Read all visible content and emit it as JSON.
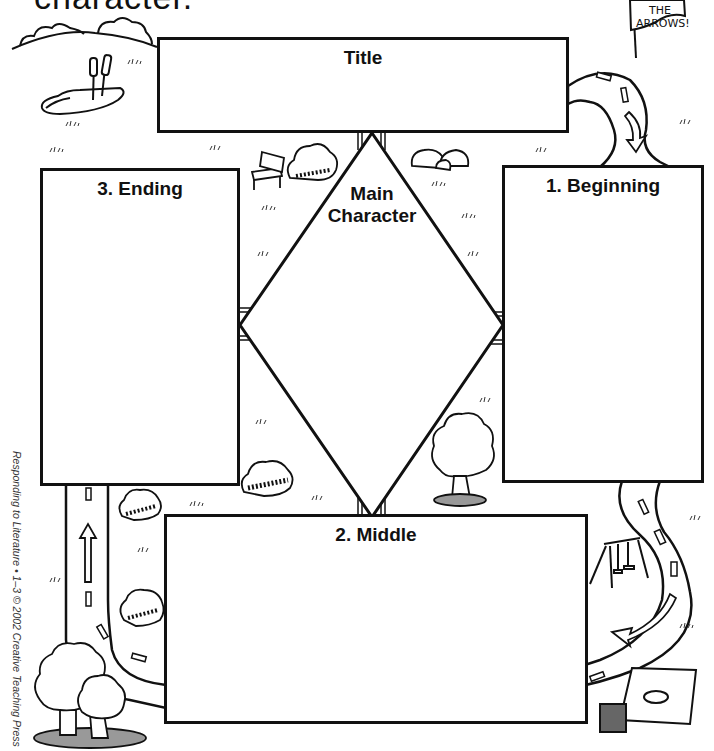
{
  "header": {
    "instruction_tail": "character."
  },
  "sign": {
    "line1": "FOLLOW",
    "line2": "THE",
    "line3": "ARROWS!"
  },
  "boxes": {
    "title": {
      "label": "Title"
    },
    "main_character": {
      "label_line1": "Main",
      "label_line2": "Character"
    },
    "beginning": {
      "label": "1. Beginning"
    },
    "middle": {
      "label": "2. Middle"
    },
    "ending": {
      "label": "3. Ending"
    }
  },
  "sequence": [
    "1. Beginning",
    "2. Middle",
    "3. Ending"
  ],
  "credit": {
    "text": "Responding to Literature • 1–3 © 2002 Creative Teaching Press"
  },
  "colors": {
    "ink": "#111111",
    "paper": "#ffffff"
  },
  "decorations": {
    "icons": [
      "pond-icon",
      "cattails-icon",
      "hill-bushes-icon",
      "bench-icon",
      "bush-icon",
      "rocks-icon",
      "road-icon",
      "arrow-icon",
      "swing-set-icon",
      "sandbox-icon",
      "tree-icon",
      "sign-icon",
      "grass-tufts-icon"
    ]
  }
}
